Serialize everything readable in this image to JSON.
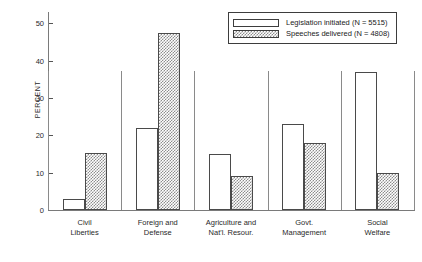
{
  "chart_data": {
    "type": "bar",
    "title": "",
    "subtitle": "",
    "xlabel": "",
    "ylabel": "PERCENT",
    "ylim": [
      0,
      53
    ],
    "grid": false,
    "legend_position": "top-right",
    "yticks": [
      0,
      10,
      20,
      30,
      40,
      50
    ],
    "ytick_labels": [
      "0",
      "10",
      "20",
      "30",
      "40",
      "50"
    ],
    "categories": [
      "Civil\nLiberties",
      "Foreign and\nDefense",
      "Agriculture and\nNat'l. Resour.",
      "Govt.\nManagement",
      "Social\nWelfare"
    ],
    "category_lines": [
      [
        "Civil",
        "Liberties"
      ],
      [
        "Foreign and",
        "Defense"
      ],
      [
        "Agriculture and",
        "Nat'l. Resour."
      ],
      [
        "Govt.",
        "Management"
      ],
      [
        "Social",
        "Welfare"
      ]
    ],
    "series": [
      {
        "name": "Legislation initiated (N = 5515)",
        "short_name": "Legislation initiated",
        "n": 5515,
        "style": "open",
        "values": [
          3,
          22,
          15,
          23,
          37
        ]
      },
      {
        "name": "Speeches delivered (N = 4808)",
        "short_name": "Speeches delivered",
        "n": 4808,
        "style": "hatch",
        "values": [
          15.3,
          47.5,
          9,
          18,
          10
        ]
      }
    ]
  },
  "legend": {
    "items": [
      {
        "label": "Legislation initiated (N = 5515)",
        "style": "open"
      },
      {
        "label": "Speeches delivered (N = 4808)",
        "style": "hatch"
      }
    ]
  },
  "colors": {
    "background": "#ffffff",
    "axis": "#7a7a7a",
    "bar_outline": "#4a4a4a",
    "hatch": "#8d8d8d",
    "text": "#1a1a1a"
  }
}
